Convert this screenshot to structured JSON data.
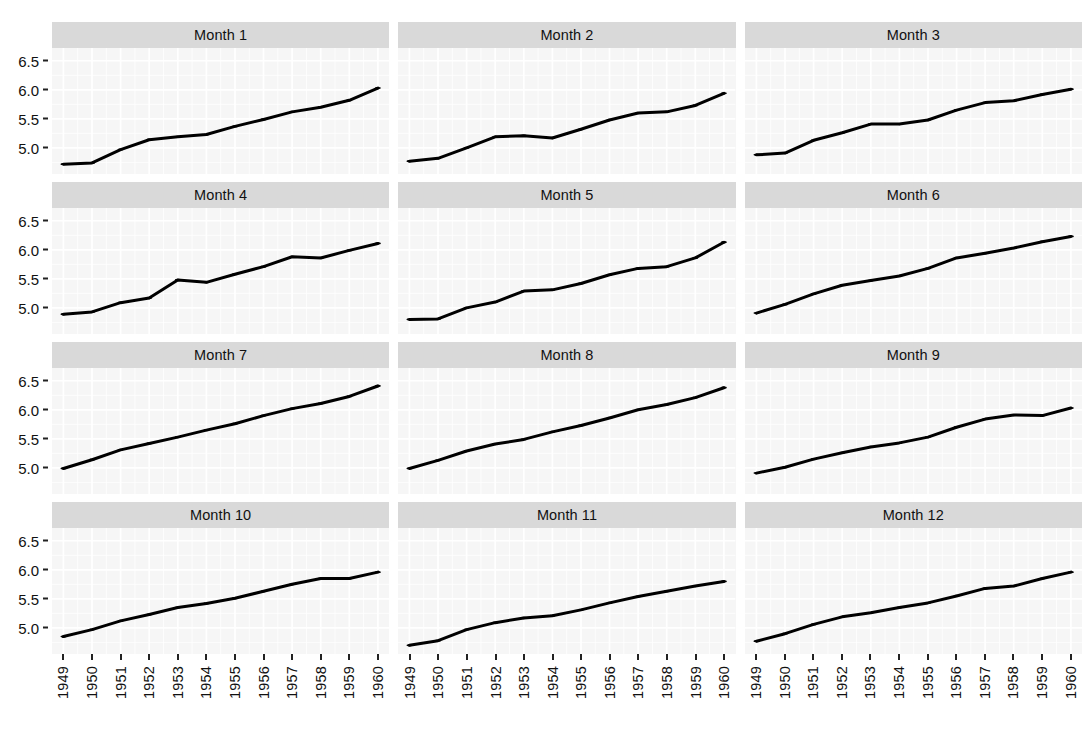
{
  "figure": {
    "kind": "faceted-line-chart",
    "panel_background": "#f6f6f6",
    "strip_background": "#d9d9d9",
    "line_color": "#000000",
    "grid_color": "#ffffff",
    "rows": 4,
    "columns": 3
  },
  "axes": {
    "y_ticks": [
      "5.0",
      "5.5",
      "6.0",
      "6.5"
    ],
    "y_tick_values": [
      5.0,
      5.5,
      6.0,
      6.5
    ],
    "y_limits": [
      4.55,
      6.72
    ],
    "x_ticks": [
      "1949",
      "1950",
      "1951",
      "1952",
      "1953",
      "1954",
      "1955",
      "1956",
      "1957",
      "1958",
      "1959",
      "1960"
    ],
    "x_tick_values": [
      1949,
      1950,
      1951,
      1952,
      1953,
      1954,
      1955,
      1956,
      1957,
      1958,
      1959,
      1960
    ],
    "x_limits": [
      1948.6,
      1960.4
    ],
    "xlabel": "",
    "ylabel": ""
  },
  "chart_data": {
    "type": "line",
    "title": "",
    "subtitle": "",
    "xlabel": "",
    "ylabel": "",
    "xlim": [
      1948.6,
      1960.4
    ],
    "ylim": [
      4.55,
      6.72
    ],
    "grid": true,
    "legend": "none",
    "x": [
      1949,
      1950,
      1951,
      1952,
      1953,
      1954,
      1955,
      1956,
      1957,
      1958,
      1959,
      1960
    ],
    "facet_variable": "Month",
    "series": [
      {
        "name": "Month 1",
        "values": [
          4.72,
          4.74,
          4.97,
          5.14,
          5.19,
          5.23,
          5.37,
          5.49,
          5.62,
          5.7,
          5.82,
          6.03
        ]
      },
      {
        "name": "Month 2",
        "values": [
          4.77,
          4.82,
          5.0,
          5.19,
          5.21,
          5.17,
          5.32,
          5.48,
          5.6,
          5.62,
          5.73,
          5.94
        ]
      },
      {
        "name": "Month 3",
        "values": [
          4.88,
          4.91,
          5.13,
          5.26,
          5.41,
          5.41,
          5.48,
          5.65,
          5.78,
          5.81,
          5.92,
          6.01
        ]
      },
      {
        "name": "Month 4",
        "values": [
          4.89,
          4.93,
          5.09,
          5.17,
          5.48,
          5.44,
          5.58,
          5.71,
          5.88,
          5.86,
          5.99,
          6.11
        ]
      },
      {
        "name": "Month 5",
        "values": [
          4.8,
          4.81,
          5.0,
          5.1,
          5.29,
          5.31,
          5.42,
          5.57,
          5.68,
          5.71,
          5.86,
          6.13
        ]
      },
      {
        "name": "Month 6",
        "values": [
          4.91,
          5.06,
          5.24,
          5.39,
          5.47,
          5.55,
          5.68,
          5.86,
          5.94,
          6.03,
          6.14,
          6.23
        ]
      },
      {
        "name": "Month 7",
        "values": [
          4.99,
          5.14,
          5.31,
          5.42,
          5.53,
          5.65,
          5.76,
          5.9,
          6.02,
          6.11,
          6.23,
          6.41
        ]
      },
      {
        "name": "Month 8",
        "values": [
          4.99,
          5.13,
          5.29,
          5.41,
          5.49,
          5.62,
          5.73,
          5.86,
          6.0,
          6.09,
          6.21,
          6.38
        ]
      },
      {
        "name": "Month 9",
        "values": [
          4.91,
          5.01,
          5.15,
          5.26,
          5.36,
          5.43,
          5.53,
          5.7,
          5.84,
          5.91,
          5.9,
          6.03
        ]
      },
      {
        "name": "Month 10",
        "values": [
          4.85,
          4.97,
          5.12,
          5.23,
          5.35,
          5.42,
          5.51,
          5.63,
          5.75,
          5.85,
          5.85,
          5.96
        ]
      },
      {
        "name": "Month 11",
        "values": [
          4.7,
          4.78,
          4.97,
          5.09,
          5.17,
          5.21,
          5.31,
          5.43,
          5.54,
          5.63,
          5.72,
          5.8
        ]
      },
      {
        "name": "Month 12",
        "values": [
          4.77,
          4.9,
          5.06,
          5.19,
          5.26,
          5.35,
          5.43,
          5.55,
          5.68,
          5.72,
          5.85,
          5.96
        ]
      }
    ]
  },
  "facets": [
    {
      "label": "Month 1",
      "series_index": 0
    },
    {
      "label": "Month 2",
      "series_index": 1
    },
    {
      "label": "Month 3",
      "series_index": 2
    },
    {
      "label": "Month 4",
      "series_index": 3
    },
    {
      "label": "Month 5",
      "series_index": 4
    },
    {
      "label": "Month 6",
      "series_index": 5
    },
    {
      "label": "Month 7",
      "series_index": 6
    },
    {
      "label": "Month 8",
      "series_index": 7
    },
    {
      "label": "Month 9",
      "series_index": 8
    },
    {
      "label": "Month 10",
      "series_index": 9
    },
    {
      "label": "Month 11",
      "series_index": 10
    },
    {
      "label": "Month 12",
      "series_index": 11
    }
  ]
}
